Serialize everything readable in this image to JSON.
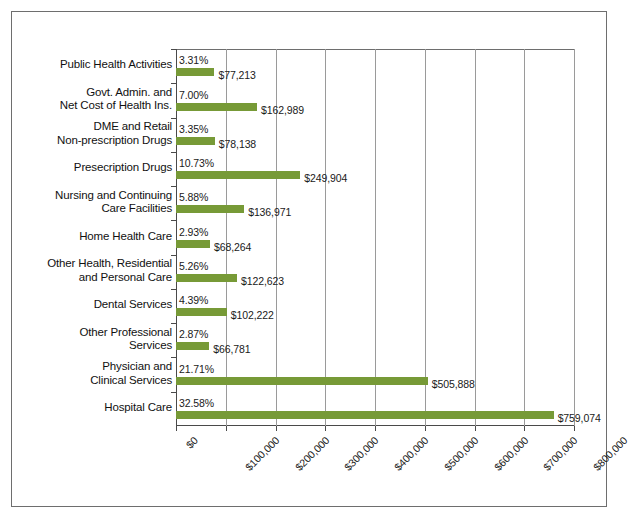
{
  "chart_data": {
    "type": "bar",
    "orientation": "horizontal",
    "title": "",
    "xlabel": "",
    "ylabel": "",
    "xlim": [
      0,
      800000
    ],
    "xticks": [
      0,
      100000,
      200000,
      300000,
      400000,
      500000,
      600000,
      700000,
      800000
    ],
    "xtick_labels": [
      "$0",
      "$100,000",
      "$200,000",
      "$300,000",
      "$400,000",
      "$500,000",
      "$600,000",
      "$700,000",
      "$800,000"
    ],
    "grid": true,
    "legend": "none",
    "bar_color": "#779a37",
    "categories": [
      "Public Health Activities",
      "Govt. Admin. and\nNet Cost of Health Ins.",
      "DME and Retail\nNon-prescription Drugs",
      "Presecription Drugs",
      "Nursing  and Continuing\nCare Facilities",
      "Home Health Care",
      "Other Health, Residential\nand Personal Care",
      "Dental Services",
      "Other Professional\nServices",
      "Physician and\nClinical Services",
      "Hospital Care"
    ],
    "values": [
      77213,
      162989,
      78138,
      249904,
      136971,
      68264,
      122623,
      102222,
      66781,
      505888,
      759074
    ],
    "value_labels": [
      "$77,213",
      "$162,989",
      "$78,138",
      "$249,904",
      "$136,971",
      "$68,264",
      "$122,623",
      "$102,222",
      "$66,781",
      "$505,888",
      "$759,074"
    ],
    "percent_labels": [
      "3.31%",
      "7.00%",
      "3.35%",
      "10.73%",
      "5.88%",
      "2.93%",
      "5.26%",
      "4.39%",
      "2.87%",
      "21.71%",
      "32.58%"
    ],
    "percent_values": [
      3.31,
      7.0,
      3.35,
      10.73,
      5.88,
      2.93,
      5.26,
      4.39,
      2.87,
      21.71,
      32.58
    ]
  },
  "rows": [
    {
      "label_line1": "Public Health Activities",
      "label_line2": "",
      "value_label": "$77,213",
      "percent_label": "3.31%"
    },
    {
      "label_line1": "Govt. Admin. and",
      "label_line2": "Net Cost of Health Ins.",
      "value_label": "$162,989",
      "percent_label": "7.00%"
    },
    {
      "label_line1": "DME and Retail",
      "label_line2": "Non-prescription Drugs",
      "value_label": "$78,138",
      "percent_label": "3.35%"
    },
    {
      "label_line1": "Presecription Drugs",
      "label_line2": "",
      "value_label": "$249,904",
      "percent_label": "10.73%"
    },
    {
      "label_line1": "Nursing  and Continuing",
      "label_line2": "Care Facilities",
      "value_label": "$136,971",
      "percent_label": "5.88%"
    },
    {
      "label_line1": "Home Health Care",
      "label_line2": "",
      "value_label": "$68,264",
      "percent_label": "2.93%"
    },
    {
      "label_line1": "Other Health, Residential",
      "label_line2": "and Personal Care",
      "value_label": "$122,623",
      "percent_label": "5.26%"
    },
    {
      "label_line1": "Dental Services",
      "label_line2": "",
      "value_label": "$102,222",
      "percent_label": "4.39%"
    },
    {
      "label_line1": "Other Professional",
      "label_line2": "Services",
      "value_label": "$66,781",
      "percent_label": "2.87%"
    },
    {
      "label_line1": "Physician and",
      "label_line2": "Clinical Services",
      "value_label": "$505,888",
      "percent_label": "21.71%"
    },
    {
      "label_line1": "Hospital Care",
      "label_line2": "",
      "value_label": "$759,074",
      "percent_label": "32.58%"
    }
  ]
}
